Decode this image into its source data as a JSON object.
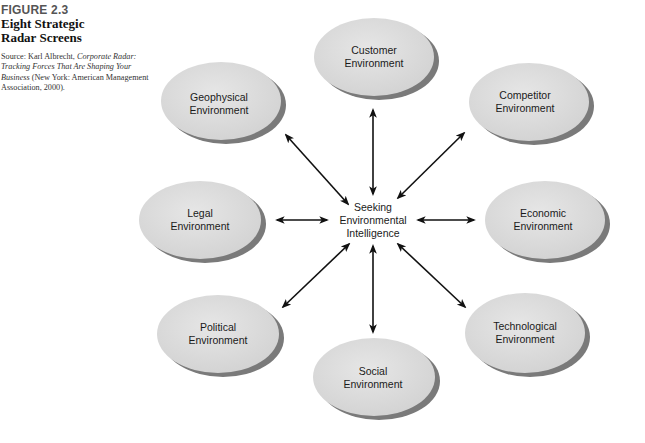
{
  "caption": {
    "figure_number": "FIGURE 2.3",
    "title_line1": "Eight Strategic",
    "title_line2": "Radar Screens",
    "source_prefix": "Source: Karl Albrecht,",
    "source_italic": "Corporate Radar: Tracking Forces That Are Shaping Your Business",
    "source_suffix": "(New York: American Management Association, 2000)."
  },
  "center": {
    "line1": "Seeking",
    "line2": "Environmental",
    "line3": "Intelligence"
  },
  "nodes": [
    {
      "id": "customer",
      "line1": "Customer",
      "line2": "Environment"
    },
    {
      "id": "competitor",
      "line1": "Competitor",
      "line2": "Environment"
    },
    {
      "id": "economic",
      "line1": "Economic",
      "line2": "Environment"
    },
    {
      "id": "technological",
      "line1": "Technological",
      "line2": "Environment"
    },
    {
      "id": "social",
      "line1": "Social",
      "line2": "Environment"
    },
    {
      "id": "political",
      "line1": "Political",
      "line2": "Environment"
    },
    {
      "id": "legal",
      "line1": "Legal",
      "line2": "Environment"
    },
    {
      "id": "geophysical",
      "line1": "Geophysical",
      "line2": "Environment"
    }
  ],
  "colors": {
    "ellipse_fill": "#dcdcdc",
    "ellipse_shadow": "#7a7a7a",
    "arrow": "#111111"
  }
}
